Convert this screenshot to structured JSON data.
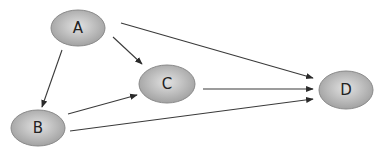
{
  "diagram": {
    "type": "directed-graph",
    "colors": {
      "node_fill_light": "#e2e2e2",
      "node_fill_dark": "#9c9c9c",
      "node_stroke": "#8a8a8a",
      "edge": "#3a3a3a",
      "label": "#222222"
    },
    "nodes": [
      {
        "id": "A",
        "label": "A"
      },
      {
        "id": "B",
        "label": "B"
      },
      {
        "id": "C",
        "label": "C"
      },
      {
        "id": "D",
        "label": "D"
      }
    ],
    "edges": [
      {
        "from": "A",
        "to": "B"
      },
      {
        "from": "A",
        "to": "C"
      },
      {
        "from": "A",
        "to": "D"
      },
      {
        "from": "B",
        "to": "C"
      },
      {
        "from": "B",
        "to": "D"
      },
      {
        "from": "C",
        "to": "D"
      }
    ]
  }
}
